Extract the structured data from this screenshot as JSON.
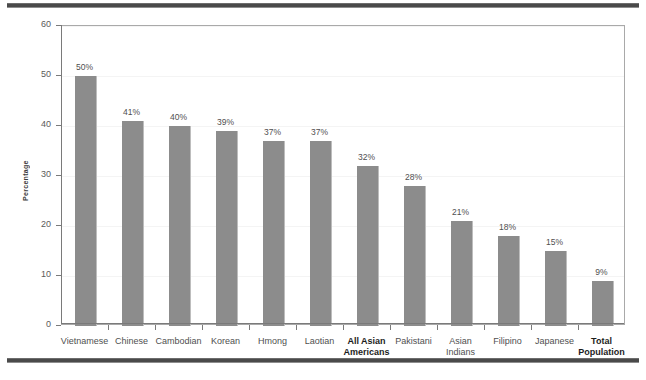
{
  "chart_data": {
    "type": "bar",
    "title": "",
    "xlabel": "",
    "ylabel": "Percentage",
    "ylim": [
      0,
      60
    ],
    "ytick_labels": [
      "0",
      "10",
      "20",
      "30",
      "40",
      "50",
      "60"
    ],
    "yticks": [
      0,
      10,
      20,
      30,
      40,
      50,
      60
    ],
    "grid": "faint horizontal gridlines at y tick values",
    "legend": "none",
    "bar_color": "#8c8c8c",
    "value_label_suffix": "%",
    "categories": [
      "Vietnamese",
      "Chinese",
      "Cambodian",
      "Korean",
      "Hmong",
      "Laotian",
      "All Asian Americans",
      "Pakistani",
      "Asian Indians",
      "Filipino",
      "Japanese",
      "Total Population"
    ],
    "category_lines": [
      [
        "Vietnamese"
      ],
      [
        "Chinese"
      ],
      [
        "Cambodian"
      ],
      [
        "Korean"
      ],
      [
        "Hmong"
      ],
      [
        "Laotian"
      ],
      [
        "All Asian",
        "Americans"
      ],
      [
        "Pakistani"
      ],
      [
        "Asian",
        "Indians"
      ],
      [
        "Filipino"
      ],
      [
        "Japanese"
      ],
      [
        "Total",
        "Population"
      ]
    ],
    "category_emphasis": [
      false,
      false,
      false,
      false,
      false,
      false,
      true,
      false,
      false,
      false,
      false,
      true
    ],
    "values": [
      50,
      41,
      40,
      39,
      37,
      37,
      32,
      28,
      21,
      18,
      15,
      9
    ],
    "value_labels": [
      "50%",
      "41%",
      "40%",
      "39%",
      "37%",
      "37%",
      "32%",
      "28%",
      "21%",
      "18%",
      "15%",
      "9%"
    ]
  },
  "decor": {
    "top_rule": "horizontal-rule",
    "bottom_rule": "horizontal-rule"
  }
}
